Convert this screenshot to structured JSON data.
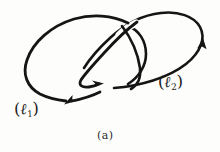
{
  "figure": {
    "caption": "(a)",
    "background_color": "#fdfdfb",
    "ink_color": "#151515"
  },
  "labels": {
    "loop1": {
      "open_paren": "(",
      "symbol": "ℓ",
      "subscript": "1",
      "close_paren": ")",
      "full": "(ℓ1)"
    },
    "loop2": {
      "open_paren": "(",
      "symbol": "ℓ",
      "subscript": "2",
      "close_paren": ")",
      "full": "(ℓ2)"
    }
  },
  "curves": [
    {
      "name": "loop-1",
      "label": "(ℓ1)",
      "orientation": "counterclockwise",
      "arrow_count": 2
    },
    {
      "name": "loop-2",
      "label": "(ℓ2)",
      "orientation": "counterclockwise",
      "arrow_count": 1
    }
  ],
  "arrows": [
    {
      "name": "arrowhead-loop1-bottom",
      "direction": "left"
    },
    {
      "name": "arrowhead-loop1-inner",
      "direction": "right"
    },
    {
      "name": "arrowhead-loop2-right",
      "direction": "up"
    }
  ]
}
